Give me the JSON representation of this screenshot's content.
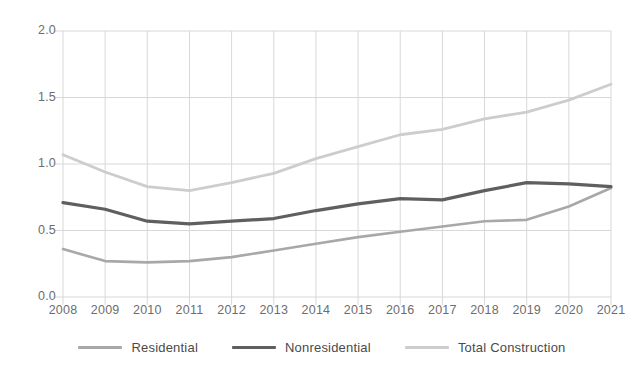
{
  "chart_data": {
    "type": "line",
    "title": "",
    "subtitle": "",
    "xlabel": "",
    "ylabel": "",
    "grid": true,
    "legend_position": "bottom",
    "x": [
      2008,
      2009,
      2010,
      2011,
      2012,
      2013,
      2014,
      2015,
      2016,
      2017,
      2018,
      2019,
      2020,
      2021
    ],
    "categories": [
      "2008",
      "2009",
      "2010",
      "2011",
      "2012",
      "2013",
      "2014",
      "2015",
      "2016",
      "2017",
      "2018",
      "2019",
      "2020",
      "2021"
    ],
    "xlim": [
      2008,
      2021
    ],
    "ylim": [
      0.0,
      2.0
    ],
    "yticks": [
      0.0,
      0.5,
      1.0,
      1.5,
      2.0
    ],
    "ytick_labels": [
      "0.0",
      "0.5",
      "1.0",
      "1.5",
      "2.0"
    ],
    "series": [
      {
        "name": "Residential",
        "color": "#a8a8a8",
        "width": 2.6,
        "values": [
          0.36,
          0.27,
          0.26,
          0.27,
          0.3,
          0.35,
          0.4,
          0.45,
          0.49,
          0.53,
          0.57,
          0.58,
          0.68,
          0.82
        ]
      },
      {
        "name": "Nonresidential",
        "color": "#5f5f5f",
        "width": 3.2,
        "values": [
          0.71,
          0.66,
          0.57,
          0.55,
          0.57,
          0.59,
          0.65,
          0.7,
          0.74,
          0.73,
          0.8,
          0.86,
          0.85,
          0.83
        ]
      },
      {
        "name": "Total Construction",
        "color": "#cdcdcd",
        "width": 2.8,
        "values": [
          1.07,
          0.94,
          0.83,
          0.8,
          0.86,
          0.93,
          1.04,
          1.13,
          1.22,
          1.26,
          1.34,
          1.39,
          1.48,
          1.6
        ]
      }
    ]
  },
  "legend": {
    "items": [
      {
        "label": "Residential",
        "color": "#a8a8a8"
      },
      {
        "label": "Nonresidential",
        "color": "#5f5f5f"
      },
      {
        "label": "Total Construction",
        "color": "#cdcdcd"
      }
    ]
  },
  "axes": {
    "grid_color": "#d8d8d8",
    "tick_color": "#6d6d6d"
  }
}
